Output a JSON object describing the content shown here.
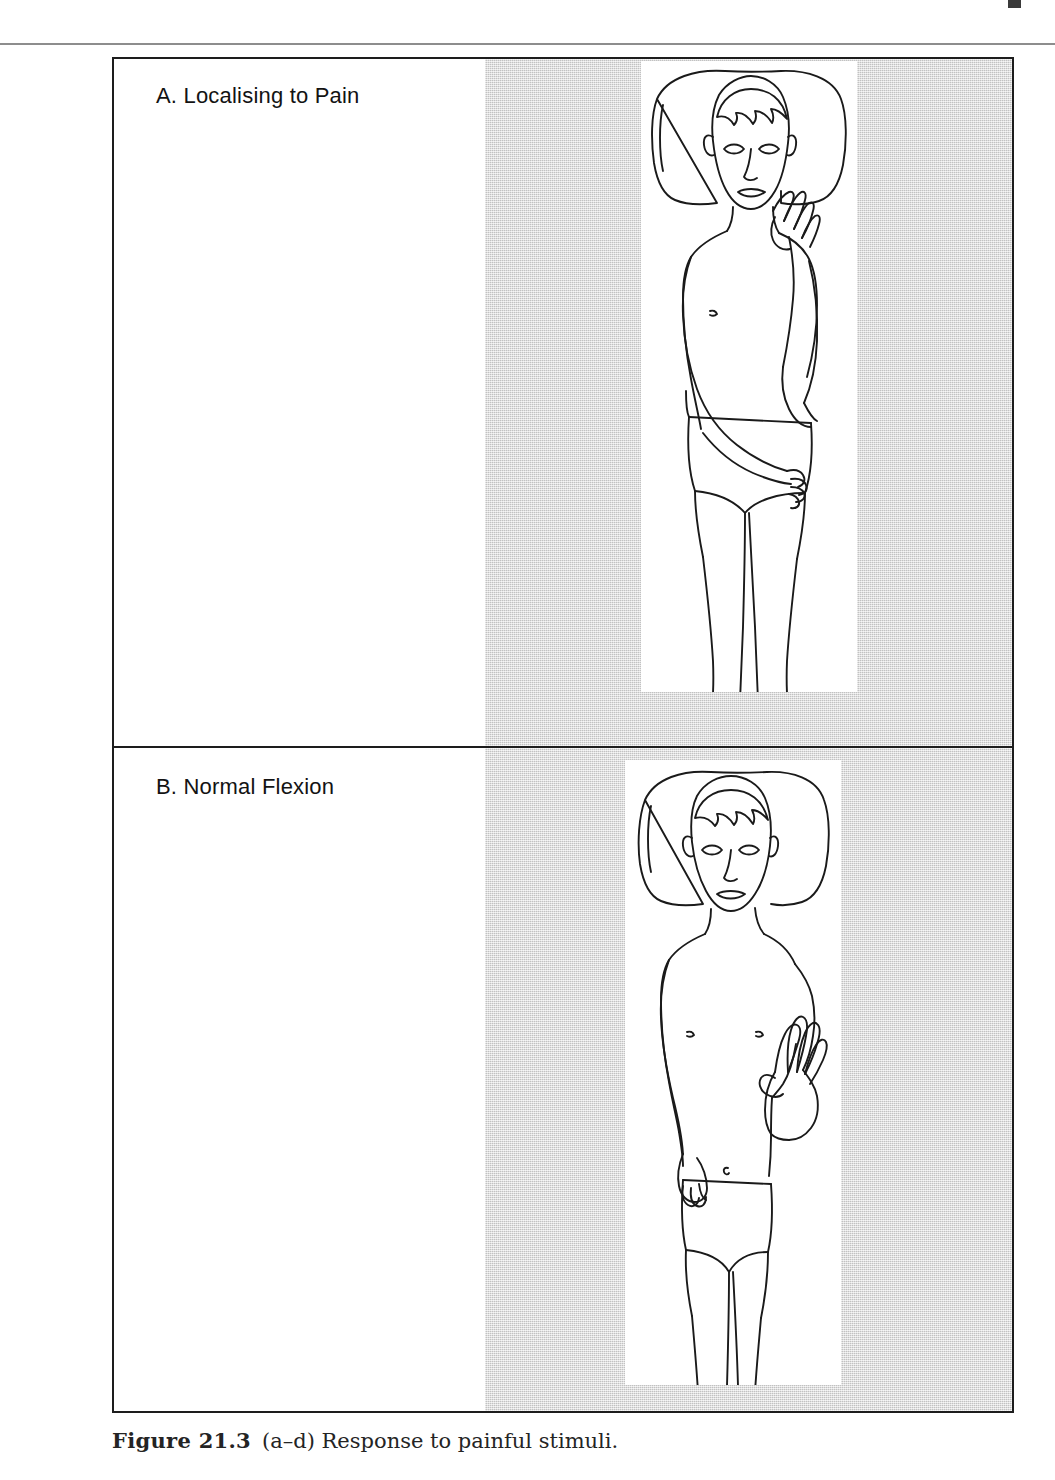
{
  "page": {
    "top_mark": "page-corner-mark",
    "header_rule": "horizontal-rule"
  },
  "figure": {
    "caption_number": "Figure 21.3",
    "caption_text": "(a–d) Response to painful stimuli.",
    "border_color": "#1d1d1d",
    "background_color": "#ffffff",
    "shade_color": "#d9d9d9",
    "line_art_color": "#1a1a1a",
    "panels": [
      {
        "key": "a",
        "label": "A. Localising to Pain",
        "illustration": "supine-patient-hand-localising-to-neck",
        "description_parts": [
          "pillow",
          "head-with-short-hair",
          "face-eyes-nose-mouth",
          "right-arm-flexed-hand-at-neck",
          "left-arm-across-abdomen",
          "torso-with-nipple",
          "underwear",
          "legs",
          "feet-with-toes"
        ]
      },
      {
        "key": "b",
        "label": "B. Normal Flexion",
        "illustration": "supine-patient-arm-flexed-beside-head",
        "description_parts": [
          "pillow",
          "head-with-short-hair",
          "face-eyes-nose-mouth",
          "right-arm-flexed-up-fingers-spread",
          "left-arm-extended-at-side",
          "torso-with-nipples-and-navel",
          "underwear",
          "legs",
          "feet-with-toes"
        ]
      }
    ]
  }
}
